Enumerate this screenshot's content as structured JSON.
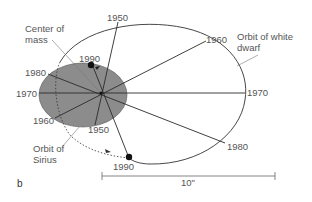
{
  "panel_label": "b",
  "colors": {
    "sirius_fill": "#8c8c8c",
    "line": "#333333",
    "text": "#555555",
    "background": "#ffffff"
  },
  "labels": {
    "center_of_mass_line1": "Center of",
    "center_of_mass_line2": "mass",
    "white_dwarf_line1": "Orbit of white",
    "white_dwarf_line2": "dwarf",
    "sirius_line1": "Orbit of",
    "sirius_line2": "Sirius",
    "scale": "10\""
  },
  "white_dwarf_orbit": {
    "years": [
      "1950",
      "1960",
      "1970",
      "1980",
      "1990"
    ]
  },
  "sirius_orbit": {
    "years": [
      "1950",
      "1960",
      "1970",
      "1980",
      "1990"
    ]
  }
}
